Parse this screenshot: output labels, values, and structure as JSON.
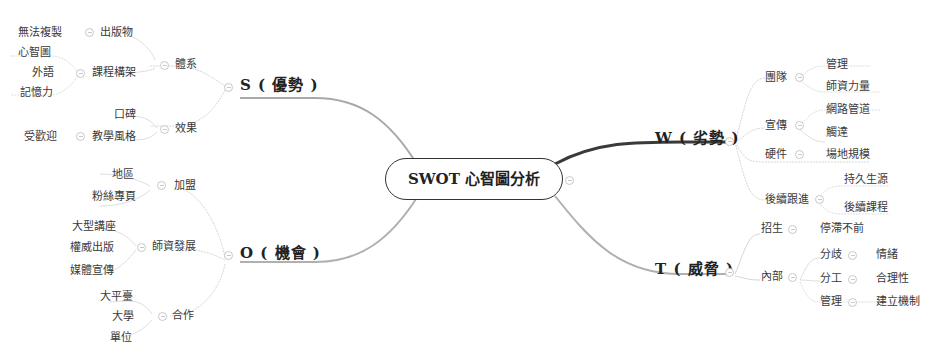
{
  "root": {
    "label": "SWOT 心智圖分析"
  },
  "branches": {
    "S": {
      "label": "S ( 優勢 )",
      "children": [
        {
          "label": "體系",
          "children": [
            {
              "label": "出版物",
              "children": [
                {
                  "label": "無法複製"
                }
              ]
            },
            {
              "label": "課程構架",
              "children": [
                {
                  "label": "心智圖"
                },
                {
                  "label": "外語"
                },
                {
                  "label": "記憶力"
                }
              ]
            }
          ]
        },
        {
          "label": "效果",
          "children": [
            {
              "label": "口碑"
            },
            {
              "label": "教學風格",
              "children": [
                {
                  "label": "受歡迎"
                }
              ]
            }
          ]
        }
      ]
    },
    "W": {
      "label": "W ( 劣勢 )",
      "children": [
        {
          "label": "團隊",
          "children": [
            {
              "label": "管理"
            },
            {
              "label": "師資力量"
            }
          ]
        },
        {
          "label": "宣傳",
          "children": [
            {
              "label": "網路管道"
            },
            {
              "label": "觸達"
            }
          ]
        },
        {
          "label": "硬件",
          "children": [
            {
              "label": "場地規模"
            }
          ]
        },
        {
          "label": "後續跟進",
          "children": [
            {
              "label": "持久生源"
            },
            {
              "label": "後續課程"
            }
          ]
        }
      ]
    },
    "O": {
      "label": "O ( 機會 )",
      "children": [
        {
          "label": "加盟",
          "children": [
            {
              "label": "地區"
            },
            {
              "label": "粉絲專頁"
            }
          ]
        },
        {
          "label": "師資發展",
          "children": [
            {
              "label": "大型講座"
            },
            {
              "label": "權威出版"
            },
            {
              "label": "媒體宣傳"
            }
          ]
        },
        {
          "label": "合作",
          "children": [
            {
              "label": "大平臺"
            },
            {
              "label": "大學"
            },
            {
              "label": "單位"
            }
          ]
        }
      ]
    },
    "T": {
      "label": "T ( 威脅 )",
      "children": [
        {
          "label": "招生",
          "children": [
            {
              "label": "停滯不前"
            }
          ]
        },
        {
          "label": "內部",
          "children": [
            {
              "label": "分歧",
              "children": [
                {
                  "label": "情緒"
                }
              ]
            },
            {
              "label": "分工",
              "children": [
                {
                  "label": "合理性"
                }
              ]
            },
            {
              "label": "管理",
              "children": [
                {
                  "label": "建立機制"
                }
              ]
            }
          ]
        }
      ]
    }
  },
  "colors": {
    "root_border": "#333333",
    "w_link": "#3a3a3a",
    "link_light": "#d0d0d0",
    "main_link": "#9a9a9a"
  }
}
